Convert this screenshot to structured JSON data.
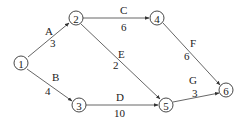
{
  "diagram": {
    "type": "activity-on-arrow network",
    "nodes": [
      {
        "id": "1",
        "label": "1",
        "x": 21,
        "y": 63
      },
      {
        "id": "2",
        "label": "2",
        "x": 76,
        "y": 18
      },
      {
        "id": "3",
        "label": "3",
        "x": 79,
        "y": 105
      },
      {
        "id": "4",
        "label": "4",
        "x": 157,
        "y": 18
      },
      {
        "id": "5",
        "label": "5",
        "x": 166,
        "y": 105
      },
      {
        "id": "6",
        "label": "6",
        "x": 226,
        "y": 90
      }
    ],
    "edges": [
      {
        "from": "1",
        "to": "2",
        "activity": "A",
        "duration": "3"
      },
      {
        "from": "1",
        "to": "3",
        "activity": "B",
        "duration": "4"
      },
      {
        "from": "2",
        "to": "4",
        "activity": "C",
        "duration": "6"
      },
      {
        "from": "3",
        "to": "5",
        "activity": "D",
        "duration": "10"
      },
      {
        "from": "2",
        "to": "5",
        "activity": "E",
        "duration": "2"
      },
      {
        "from": "4",
        "to": "6",
        "activity": "F",
        "duration": "6"
      },
      {
        "from": "5",
        "to": "6",
        "activity": "G",
        "duration": "3"
      }
    ]
  }
}
